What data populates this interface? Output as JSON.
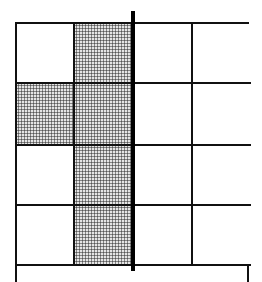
{
  "diagram": {
    "type": "grid",
    "columns": 4,
    "rows_visible": 4,
    "grid_left_px": 15,
    "grid_top_px": 22,
    "column_widths_px": [
      58,
      60,
      58,
      58
    ],
    "row_heights_px": [
      60,
      62,
      60,
      60
    ],
    "shaded_cells": [
      {
        "row": 0,
        "col": 1
      },
      {
        "row": 1,
        "col": 0
      },
      {
        "row": 1,
        "col": 1
      },
      {
        "row": 2,
        "col": 1
      },
      {
        "row": 3,
        "col": 1
      }
    ],
    "shading_style": "dot-stipple",
    "colors": {
      "line": "#111111",
      "shade_background": "#e4e4e4",
      "shade_dots": "#555555",
      "divider": "#000000",
      "background": "#ffffff"
    },
    "divider_line": {
      "orientation": "vertical",
      "position": "between column 2 and column 3",
      "x_px": 131,
      "width_px": 4,
      "extends_above_grid": true
    },
    "bottom_row_cropped": true
  }
}
